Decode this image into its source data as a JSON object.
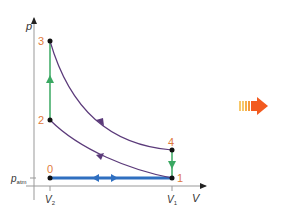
{
  "diagram": {
    "type": "pV-diagram",
    "axes": {
      "y_label": "p",
      "x_label": "V",
      "y_tick_label": "p",
      "y_tick_subscript": "atm",
      "x_ticks": [
        {
          "label": "V",
          "subscript": "2"
        },
        {
          "label": "V",
          "subscript": "1"
        }
      ]
    },
    "points": [
      {
        "id": "0",
        "label": "0"
      },
      {
        "id": "1",
        "label": "1"
      },
      {
        "id": "2",
        "label": "2"
      },
      {
        "id": "3",
        "label": "3"
      },
      {
        "id": "4",
        "label": "4"
      }
    ],
    "processes": [
      {
        "from": "0",
        "to": "1",
        "kind": "isobaric intake/exhaust",
        "color": "#2f6fc0"
      },
      {
        "from": "1",
        "to": "2",
        "kind": "adiabatic compression",
        "color": "#5b3a7a"
      },
      {
        "from": "2",
        "to": "3",
        "kind": "isochoric heating",
        "color": "#3aa862"
      },
      {
        "from": "3",
        "to": "4",
        "kind": "adiabatic expansion",
        "color": "#5b3a7a"
      },
      {
        "from": "4",
        "to": "1",
        "kind": "isochoric cooling",
        "color": "#3aa862"
      }
    ],
    "colors": {
      "point_labels": "#e07a3c",
      "axes": "#888888",
      "arrow_solid": "#f25a1f",
      "arrow_stripes": "#f7c86a"
    }
  }
}
